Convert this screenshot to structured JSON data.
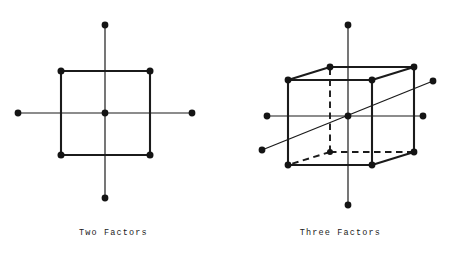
{
  "figure": {
    "background_color": "#ffffff",
    "ink_color": "#1b1b1b",
    "style": "scanned typewriter line drawing"
  },
  "panels": [
    {
      "id": "two-factors",
      "caption": "Two Factors",
      "design_type": "central composite design (2 factors)",
      "point_counts": {
        "factorial_corner_points": 4,
        "center_points": 1,
        "axial_star_points": 4,
        "total_points": 9
      },
      "geometry": {
        "square": {
          "left": 61,
          "top": 71,
          "right": 150,
          "bottom": 155
        },
        "center": {
          "x": 105,
          "y": 113
        },
        "axes": {
          "horizontal": {
            "x1": 18,
            "y1": 113,
            "x2": 192,
            "y2": 113
          },
          "vertical": {
            "x1": 105,
            "y1": 25,
            "x2": 105,
            "y2": 198
          }
        },
        "corner_points": [
          {
            "x": 61,
            "y": 71
          },
          {
            "x": 150,
            "y": 71
          },
          {
            "x": 150,
            "y": 155
          },
          {
            "x": 61,
            "y": 155
          }
        ],
        "star_points": [
          {
            "x": 18,
            "y": 113
          },
          {
            "x": 192,
            "y": 113
          },
          {
            "x": 105,
            "y": 25
          },
          {
            "x": 105,
            "y": 198
          }
        ]
      }
    },
    {
      "id": "three-factors",
      "caption": "Three Factors",
      "design_type": "central composite design (3 factors)",
      "point_counts": {
        "factorial_corner_points": 8,
        "center_points": 1,
        "axial_star_points": 6,
        "total_points": 15
      },
      "geometry": {
        "cube_front_face": {
          "left": 61,
          "top": 80,
          "right": 145,
          "bottom": 165
        },
        "depth_offset": {
          "dx": 42,
          "dy": -13
        },
        "center": {
          "x": 121,
          "y": 116
        },
        "axes": {
          "horizontal": {
            "x1": 40,
            "y1": 116,
            "x2": 196,
            "y2": 116
          },
          "vertical": {
            "x1": 121,
            "y1": 25,
            "x2": 121,
            "y2": 205
          },
          "diagonal": {
            "x1": 35,
            "y1": 150,
            "x2": 206,
            "y2": 81
          }
        },
        "hidden_vertex": {
          "x": 103,
          "y": 152
        },
        "dashed_edges": [
          "back-bottom-left to front-bottom-left",
          "back-bottom-left to back-bottom-right",
          "back-bottom-left to back-top-left"
        ],
        "visible_vertices": [
          {
            "x": 61,
            "y": 80
          },
          {
            "x": 145,
            "y": 80
          },
          {
            "x": 145,
            "y": 165
          },
          {
            "x": 61,
            "y": 165
          },
          {
            "x": 103,
            "y": 67
          },
          {
            "x": 187,
            "y": 67
          },
          {
            "x": 187,
            "y": 152
          }
        ],
        "star_points": [
          {
            "x": 40,
            "y": 116
          },
          {
            "x": 196,
            "y": 116
          },
          {
            "x": 121,
            "y": 25
          },
          {
            "x": 121,
            "y": 205
          },
          {
            "x": 35,
            "y": 150
          },
          {
            "x": 206,
            "y": 81
          }
        ]
      }
    }
  ]
}
